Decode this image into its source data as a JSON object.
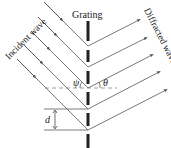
{
  "labels": {
    "grating": "Grating",
    "incident": "Incident wave",
    "diffracted": "Diffracted wave",
    "psi": "ψ",
    "theta": "θ",
    "d": "d"
  },
  "colors": {
    "ray": "#555555",
    "grating": "#222222",
    "dashed": "#888888"
  },
  "grating": {
    "x": 88,
    "slits_y": [
      46,
      67,
      88,
      109,
      130
    ],
    "bars": [
      [
        21,
        41
      ],
      [
        50,
        62
      ],
      [
        71,
        84
      ],
      [
        92,
        105
      ],
      [
        113,
        126
      ],
      [
        134,
        148
      ]
    ]
  }
}
